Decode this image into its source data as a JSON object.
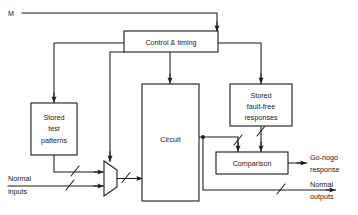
{
  "diagram": {
    "colors": {
      "stroke": "#1a1a1a",
      "fill": "#ffffff",
      "background": "#ffffff"
    },
    "blocks": [
      {
        "id": "control-timing",
        "label": "Control & timing",
        "lines": [
          "Control & timing"
        ]
      },
      {
        "id": "stored-test-patterns",
        "label": "Stored test patterns",
        "lines": [
          "Stored",
          "test",
          "patterns"
        ]
      },
      {
        "id": "circuit",
        "label": "Circuit",
        "lines": [
          "Circuit"
        ]
      },
      {
        "id": "stored-fault-free-responses",
        "label": "Stored fault-free responses",
        "lines": [
          "Stored",
          "fault-free",
          "responses"
        ]
      },
      {
        "id": "comparison",
        "label": "Comparison",
        "lines": [
          "Comparison"
        ]
      },
      {
        "id": "multiplexer",
        "label": "Multiplexer",
        "lines": []
      }
    ],
    "labels": {
      "mode_input": "M",
      "normal_inputs_line1": "Normal",
      "normal_inputs_line2": "inputs",
      "go_nogo_line1": "Go-nogo",
      "go_nogo_line2": "response",
      "normal_outputs_line1": "Normal",
      "normal_outputs_line2": "outputs"
    },
    "block_text": {
      "control_timing": "Control & timing",
      "stored_test_1": "Stored",
      "stored_test_2": "test",
      "stored_test_3": "patterns",
      "circuit": "Circuit",
      "stored_ff_1": "Stored",
      "stored_ff_2": "fault-free",
      "stored_ff_3": "responses",
      "comparison": "Comparison"
    }
  }
}
